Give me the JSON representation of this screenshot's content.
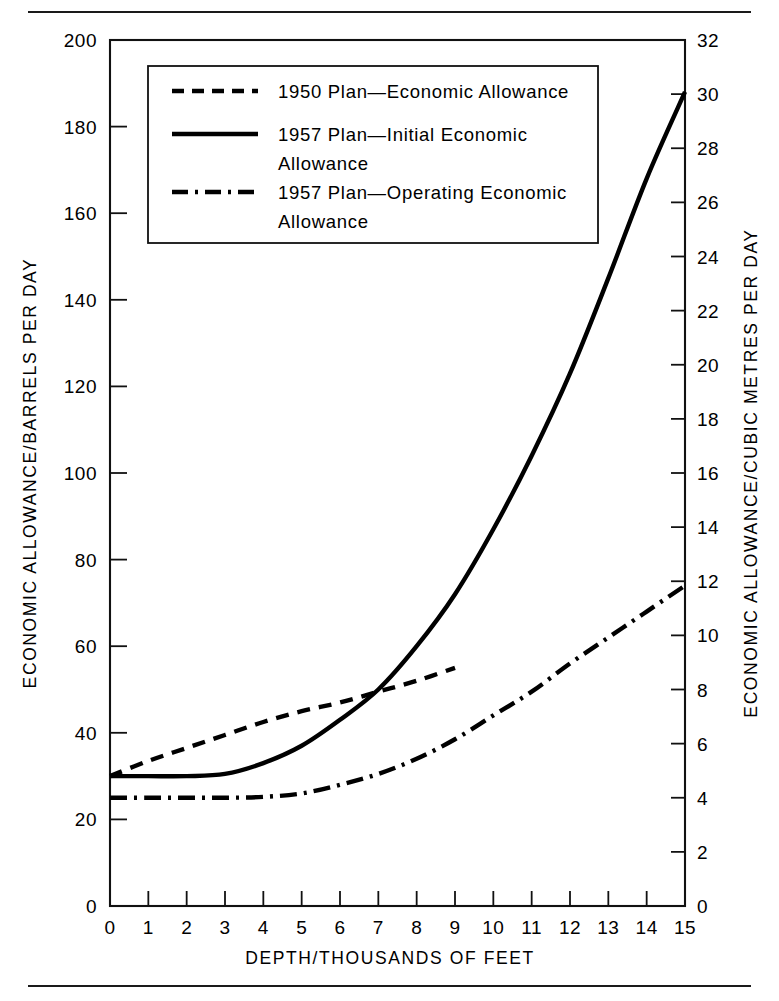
{
  "figure": {
    "background_color": "#ffffff",
    "ink_color": "#000000",
    "top_rule": true,
    "bottom_rule": true
  },
  "chart_data": {
    "type": "line",
    "title": "",
    "subtitle": "",
    "xlabel": "DEPTH/THOUSANDS OF FEET",
    "ylabel": "ECONOMIC ALLOWANCE/BARRELS PER DAY",
    "ylabel_right": "ECONOMIC ALLOWANCE/CUBIC METRES PER DAY",
    "xlim": [
      0,
      15
    ],
    "ylim": [
      0,
      200
    ],
    "ylim_right": [
      0,
      32
    ],
    "grid": false,
    "legend_position": "upper left",
    "xticks": [
      0,
      1,
      2,
      3,
      4,
      5,
      6,
      7,
      8,
      9,
      10,
      11,
      12,
      13,
      14,
      15
    ],
    "xtick_labels": [
      "0",
      "1",
      "2",
      "3",
      "4",
      "5",
      "6",
      "7",
      "8",
      "9",
      "10",
      "11",
      "12",
      "13",
      "14",
      "15"
    ],
    "yticks": [
      0,
      20,
      40,
      60,
      80,
      100,
      120,
      140,
      160,
      180,
      200
    ],
    "ytick_labels": [
      "0",
      "20",
      "40",
      "60",
      "80",
      "100",
      "120",
      "140",
      "160",
      "180",
      "200"
    ],
    "yticks_right": [
      0,
      2,
      4,
      6,
      8,
      10,
      12,
      14,
      16,
      18,
      20,
      22,
      24,
      26,
      28,
      30,
      32
    ],
    "ytick_labels_right": [
      "0",
      "2",
      "4",
      "6",
      "8",
      "10",
      "12",
      "14",
      "16",
      "18",
      "20",
      "22",
      "24",
      "26",
      "28",
      "30",
      "32"
    ],
    "series": [
      {
        "name": "1950 Plan—Economic Allowance",
        "style": "dashed",
        "x": [
          0,
          1,
          2,
          3,
          4,
          5,
          6,
          7,
          8,
          9
        ],
        "values": [
          30,
          33.5,
          36.5,
          39.5,
          42.5,
          45,
          47,
          49.5,
          52,
          55
        ]
      },
      {
        "name": "1957 Plan—Initial Economic Allowance",
        "style": "solid",
        "x": [
          0,
          1,
          2,
          3,
          4,
          5,
          6,
          7,
          8,
          9,
          10,
          11,
          12,
          13,
          14,
          15
        ],
        "values": [
          30,
          30,
          30,
          30.5,
          33,
          37,
          43,
          50,
          60,
          72,
          87,
          104,
          123,
          145,
          168,
          188
        ]
      },
      {
        "name": "1957 Plan—Operating Economic Allowance",
        "style": "dashdot",
        "x": [
          0,
          1,
          2,
          3,
          4,
          5,
          6,
          7,
          8,
          9,
          10,
          11,
          12,
          13,
          14,
          15
        ],
        "values": [
          25,
          25,
          25,
          25,
          25.2,
          26,
          28,
          30.5,
          34,
          38.5,
          44,
          49.5,
          56,
          62,
          68,
          74
        ]
      }
    ],
    "annotations": []
  },
  "legend": {
    "entries": [
      {
        "style": "dashed",
        "label_line1": "1950  Plan—Economic  Allowance",
        "label_line2": ""
      },
      {
        "style": "solid",
        "label_line1": "1957  Plan—Initial  Economic",
        "label_line2": "Allowance"
      },
      {
        "style": "dashdot",
        "label_line1": "1957  Plan—Operating  Economic",
        "label_line2": "Allowance"
      }
    ]
  },
  "axis_titles": {
    "left": "ECONOMIC ALLOWANCE/BARRELS PER DAY",
    "right": "ECONOMIC ALLOWANCE/CUBIC METRES PER DAY",
    "bottom": "DEPTH/THOUSANDS OF FEET"
  }
}
